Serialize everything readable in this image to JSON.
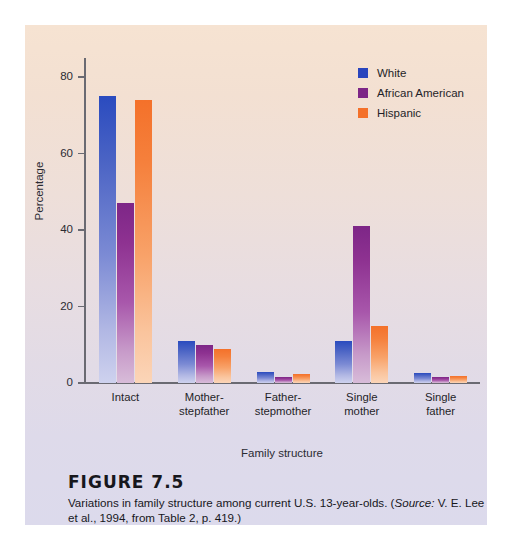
{
  "figure": {
    "number_label": "FIGURE 7.5",
    "caption_before_source": "Variations in family structure among current U.S. 13-year-olds. (",
    "caption_source_word": "Source:",
    "caption_after_source": " V. E. Lee et al., 1994, from Table 2, p. 419.)"
  },
  "legend": {
    "items": [
      {
        "label": "White",
        "color": "#2a45bd"
      },
      {
        "label": "African American",
        "color": "#7d2687"
      },
      {
        "label": "Hispanic",
        "color": "#f4712a"
      }
    ]
  },
  "axes": {
    "y_title": "Percentage",
    "x_title": "Family structure",
    "y_ticks": [
      "0",
      "20",
      "40",
      "60",
      "80"
    ]
  },
  "chart_data": {
    "type": "bar",
    "title": "Variations in family structure among current U.S. 13-year-olds",
    "xlabel": "Family structure",
    "ylabel": "Percentage",
    "ylim": [
      0,
      85
    ],
    "yticks": [
      0,
      20,
      40,
      60,
      80
    ],
    "grid": false,
    "legend_position": "top-right",
    "categories": [
      "Intact",
      "Mother-stepfather",
      "Father-stepmother",
      "Single mother",
      "Single father"
    ],
    "category_lines": [
      [
        "Intact"
      ],
      [
        "Mother-",
        "stepfather"
      ],
      [
        "Father-",
        "stepmother"
      ],
      [
        "Single",
        "mother"
      ],
      [
        "Single",
        "father"
      ]
    ],
    "series": [
      {
        "name": "White",
        "color": "#2a45bd",
        "values": [
          75,
          11,
          3,
          11,
          2.5
        ]
      },
      {
        "name": "African American",
        "color": "#7d2687",
        "values": [
          47,
          10,
          1.5,
          41,
          1.5
        ]
      },
      {
        "name": "Hispanic",
        "color": "#f4712a",
        "values": [
          74,
          9,
          2.3,
          15,
          1.8
        ]
      }
    ],
    "source": "V. E. Lee et al., 1994, from Table 2, p. 419."
  }
}
